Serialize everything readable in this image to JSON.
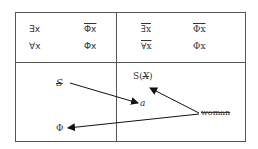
{
  "table": {
    "top_left": {
      "row1": {
        "quantifier": "∃x",
        "predicate": "Φx",
        "predicate_negated": true,
        "quantifier_negated": false
      },
      "row2": {
        "quantifier": "∀x",
        "predicate": "Φx",
        "predicate_negated": false,
        "quantifier_negated": false
      }
    },
    "top_right": {
      "row1": {
        "quantifier": "∃x",
        "predicate": "Φx",
        "predicate_negated": true,
        "quantifier_negated": true
      },
      "row2": {
        "quantifier": "∀x",
        "predicate": "Φx",
        "predicate_negated": false,
        "quantifier_negated": true
      }
    },
    "bottom": {
      "barred_s": "S",
      "s_barred": "S(X)",
      "s_barred_open": "S(",
      "s_barred_x": "X",
      "s_barred_close": ")",
      "object_a": "a",
      "woman": "woman",
      "phi": "Φ"
    }
  },
  "arrows": [
    {
      "from": "barred_s",
      "to": "object_a"
    },
    {
      "from": "woman",
      "to": "s_barred"
    },
    {
      "from": "woman",
      "to": "phi"
    }
  ],
  "colors": {
    "line": "#555555",
    "text": "#333333",
    "arrow": "#111111"
  }
}
